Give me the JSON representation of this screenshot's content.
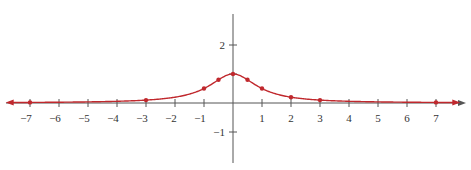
{
  "chart_data": {
    "type": "line",
    "title": "",
    "xlabel": "",
    "ylabel": "",
    "function": "y = 1/(1+x^2)",
    "xlim": [
      -7.8,
      7.8
    ],
    "ylim": [
      -1.5,
      3.1
    ],
    "grid": false,
    "legend": null,
    "x_ticks": [
      -7,
      -6,
      -5,
      -4,
      -3,
      -2,
      -1,
      1,
      2,
      3,
      4,
      5,
      6,
      7
    ],
    "y_ticks": [
      2,
      1,
      -1
    ],
    "y_tick_labels_shown": [
      2,
      -1
    ],
    "points": [
      {
        "x": -7,
        "y": 0.02
      },
      {
        "x": -3,
        "y": 0.1
      },
      {
        "x": -1,
        "y": 0.5
      },
      {
        "x": -0.5,
        "y": 0.8
      },
      {
        "x": 0,
        "y": 1
      },
      {
        "x": 0.5,
        "y": 0.8
      },
      {
        "x": 1,
        "y": 0.5
      },
      {
        "x": 2,
        "y": 0.2
      },
      {
        "x": 3,
        "y": 0.1
      },
      {
        "x": 7,
        "y": 0.02
      }
    ],
    "line_color": "#c0282d",
    "axis_color": "#555555",
    "arrows": "both ends of curve"
  }
}
